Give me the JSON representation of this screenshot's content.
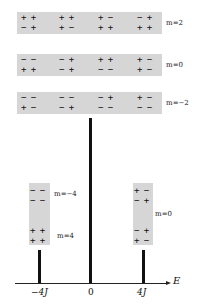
{
  "levels": [
    {
      "m_label": "m=2",
      "configs": [
        [
          "+ +",
          "- +"
        ],
        [
          "+ +",
          "+ -"
        ],
        [
          "+ -",
          "+ +"
        ],
        [
          "- +",
          "+ +"
        ]
      ]
    },
    {
      "m_label": "m=0",
      "configs": [
        [
          "- -",
          "+ +"
        ],
        [
          "- +",
          "- +"
        ],
        [
          "+ +",
          "- -"
        ],
        [
          "+ -",
          "+ -"
        ]
      ]
    },
    {
      "m_label": "m=-2",
      "configs": [
        [
          "- -",
          "+ -"
        ],
        [
          "- -",
          "- +"
        ],
        [
          "- +",
          "- -"
        ],
        [
          "+ -",
          "- -"
        ]
      ]
    }
  ],
  "left_stack": {
    "upper": {
      "m_label": "m=-4",
      "config": [
        "- -",
        "- -"
      ]
    },
    "lower": {
      "m_label": "m=4",
      "config": [
        "+ +",
        "+ +"
      ]
    }
  },
  "right_stack": {
    "m_label": "m=0",
    "upper": [
      "+ -",
      "- +"
    ],
    "lower": [
      "- +",
      "+ -"
    ]
  },
  "axis": {
    "label": "E",
    "ticks": [
      {
        "label": "-4J"
      },
      {
        "label": "0"
      },
      {
        "label": "4J"
      }
    ]
  },
  "colors": {
    "box": "#d6d6d6",
    "bar": "#111111"
  }
}
